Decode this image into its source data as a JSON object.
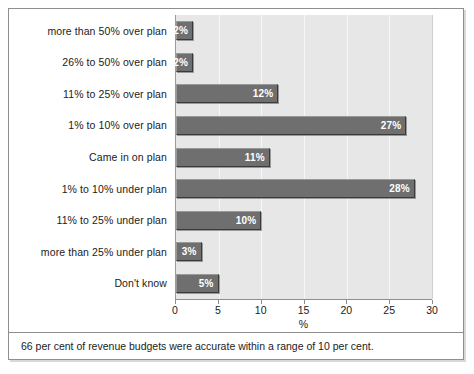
{
  "chart_data": {
    "type": "bar",
    "orientation": "horizontal",
    "title": "",
    "subtitle": "",
    "xlabel": "%",
    "ylabel": "",
    "xlim": [
      0,
      30
    ],
    "xticks": [
      0,
      5,
      10,
      15,
      20,
      25,
      30
    ],
    "xtick_labels": [
      "0",
      "5",
      "10",
      "15",
      "20",
      "25",
      "30"
    ],
    "grid": true,
    "grid_axis": "x",
    "legend": false,
    "legend_position": "none",
    "categories": [
      "more than 50% over plan",
      "26% to 50% over plan",
      "11% to 25% over plan",
      "1% to 10% over plan",
      "Came in on plan",
      "1% to 10% under plan",
      "11% to 25% under plan",
      "more than 25% under plan",
      "Don't know"
    ],
    "values": [
      2,
      2,
      12,
      27,
      11,
      28,
      10,
      3,
      5
    ],
    "value_labels": [
      "2%",
      "2%",
      "12%",
      "27%",
      "11%",
      "28%",
      "10%",
      "3%",
      "5%"
    ],
    "bar_color": "#6f6f6f",
    "bar_border_color": "#3a3a3a",
    "plot_background": "#e7e7e7",
    "value_label_color": "#ffffff",
    "annotation": "66 per cent of revenue budgets were accurate within a range of 10 per cent."
  },
  "figure": {
    "caption": "66 per cent of revenue budgets were accurate within a range of 10 per cent.",
    "border_color": "#8e8e8e",
    "background": "#ffffff"
  }
}
